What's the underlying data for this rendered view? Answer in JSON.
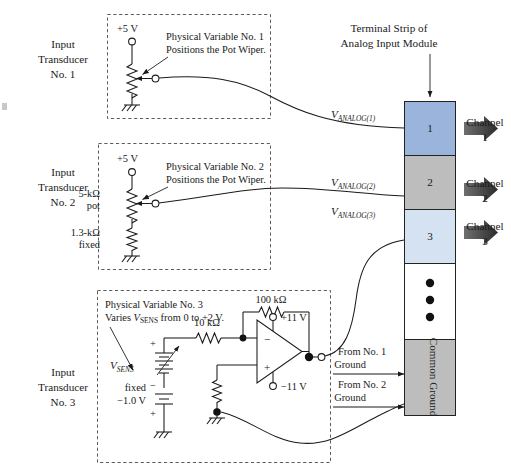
{
  "figure": {
    "terminal_strip_caption_line1": "Terminal Strip of",
    "terminal_strip_caption_line2": "Analog Input Module"
  },
  "transducers": [
    {
      "id": "no1",
      "label_line1": "Input",
      "label_line2": "Transducer",
      "label_line3": "No. 1",
      "supply": "+5 V",
      "note_line1": "Physical Variable No. 1",
      "note_line2": "Positions the Pot Wiper.",
      "signal_label_v": "V",
      "signal_label_sub": "ANALOG(1)"
    },
    {
      "id": "no2",
      "label_line1": "Input",
      "label_line2": "Transducer",
      "label_line3": "No. 2",
      "supply": "+5 V",
      "note_line1": "Physical Variable No. 2",
      "note_line2": "Positions the Pot Wiper.",
      "pot_value_line1": "5-kΩ",
      "pot_value_line2": "pot",
      "fixed_value_line1": "1.3-kΩ",
      "fixed_value_line2": "fixed",
      "signal_label_v": "V",
      "signal_label_sub": "ANALOG(2)"
    },
    {
      "id": "no3",
      "label_line1": "Input",
      "label_line2": "Transducer",
      "label_line3": "No. 3",
      "note_line1": "Physical Variable No. 3",
      "note_line2_pre": "Varies ",
      "note_line2_v": "V",
      "note_line2_sub": "SENS",
      "note_line2_post": " from 0 to +2 V.",
      "source_label_v": "V",
      "source_label_sub": "SENS",
      "source_plus": "+",
      "source_minus": "−",
      "fixed_label_line1": "fixed",
      "fixed_label_line2": "−1.0 V",
      "fixed_plus": "+",
      "input_resistor": "10 kΩ",
      "feedback_resistor": "100 kΩ",
      "opamp_inverting": "−",
      "opamp_noninverting": "+",
      "supply_positive": "+11 V",
      "supply_negative": "−11 V",
      "signal_label_v": "V",
      "signal_label_sub": "ANALOG(3)"
    }
  ],
  "ground_returns": [
    {
      "line1": "From No. 1",
      "line2": "Ground"
    },
    {
      "line1": "From No. 2",
      "line2": "Ground"
    }
  ],
  "terminal_strip": {
    "cells": [
      {
        "label": "1",
        "color": "#9bb4dc"
      },
      {
        "label": "2",
        "color": "#bdbdbd"
      },
      {
        "label": "3",
        "color": "#d5e2f2"
      },
      {
        "label": "",
        "color": "#ffffff"
      },
      {
        "label": "",
        "color": "#bdbdbd"
      }
    ],
    "common_ground_label": "Common Ground",
    "ellipsis_dots": 3
  },
  "channels": [
    {
      "line1": "Channel",
      "line2": "1"
    },
    {
      "line1": "Channel",
      "line2": "2"
    },
    {
      "line1": "Channel",
      "line2": "3"
    }
  ],
  "colors": {
    "ink": "#1a1a1a",
    "dashed_border": "#4a4a4a",
    "channel1": "#9bb4dc",
    "channel2": "#bdbdbd",
    "channel3": "#d5e2f2",
    "common_ground": "#bdbdbd",
    "arrow_dark": "#3a3a3a"
  }
}
